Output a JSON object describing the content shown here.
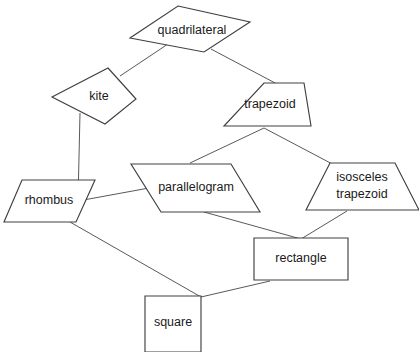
{
  "diagram": {
    "background_color": "#ffffff",
    "line_color": "#595959",
    "shape_stroke_color": "#404040",
    "shape_fill_color": "#ffffff",
    "text_color": "#1a1a1a",
    "nodes": [
      {
        "id": "quadrilateral",
        "label": "quadrilateral",
        "shape": "flat-diamond",
        "points": "178,6 250,22 204,52 130,38",
        "label_x": 192,
        "label_y": 31
      },
      {
        "id": "kite",
        "label": "kite",
        "shape": "kite",
        "points": "108,68 136,99 105,124 52,97",
        "label_x": 99,
        "label_y": 97
      },
      {
        "id": "trapezoid",
        "label": "trapezoid",
        "shape": "trapezoid",
        "points": "264,83 304,83 311,126 224,126",
        "label_x": 270,
        "label_y": 105
      },
      {
        "id": "parallelogram",
        "label": "parallelogram",
        "shape": "parallelogram",
        "points": "131,164 231,164 260,212 161,212",
        "label_x": 196,
        "label_y": 188
      },
      {
        "id": "isosceles-trapezoid",
        "label_line1": "isosceles",
        "label_line2": "trapezoid",
        "shape": "trapezoid",
        "points": "330,163 395,163 419,210 306,210",
        "label_x": 362,
        "label_y": 178,
        "label_y2": 195
      },
      {
        "id": "rhombus",
        "label": "rhombus",
        "shape": "rhombus",
        "points": "22,180 95,180 76,222 4,222",
        "label_x": 49,
        "label_y": 201
      },
      {
        "id": "rectangle",
        "label": "rectangle",
        "shape": "rectangle",
        "points": "254,238 348,238 348,280 254,280",
        "label_x": 301,
        "label_y": 259
      },
      {
        "id": "square",
        "label": "square",
        "shape": "square",
        "points": "145,296 201,296 201,352 145,352",
        "label_x": 173,
        "label_y": 323
      }
    ],
    "edges": [
      {
        "id": "quadrilateral-kite",
        "from": "quadrilateral",
        "to": "kite",
        "path": "M 168,44 L 120,76"
      },
      {
        "id": "quadrilateral-trapezoid",
        "from": "quadrilateral",
        "to": "trapezoid",
        "path": "M 211,49 L 277,84"
      },
      {
        "id": "kite-rhombus",
        "from": "kite",
        "to": "rhombus",
        "path": "M 80,113 L 78,201"
      },
      {
        "id": "trapezoid-parallelogram",
        "from": "trapezoid",
        "to": "parallelogram",
        "path": "M 264,128 L 190,163"
      },
      {
        "id": "trapezoid-isosceles-trapezoid",
        "from": "trapezoid",
        "to": "isosceles-trapezoid",
        "path": "M 264,128 L 338,167"
      },
      {
        "id": "rhombus-parallelogram",
        "from": "rhombus",
        "to": "parallelogram",
        "path": "M 78,201 L 149,188"
      },
      {
        "id": "parallelogram-rectangle",
        "from": "parallelogram",
        "to": "rectangle",
        "path": "M 204,212 L 301,239"
      },
      {
        "id": "isosceles-trapezoid-rectangle",
        "from": "isosceles-trapezoid",
        "to": "rectangle",
        "path": "M 347,211 L 301,239"
      },
      {
        "id": "rhombus-square",
        "from": "rhombus",
        "to": "square",
        "path": "M 70,222 L 201,297"
      },
      {
        "id": "rectangle-square",
        "from": "rectangle",
        "to": "square",
        "path": "M 270,281 L 201,297"
      }
    ]
  }
}
